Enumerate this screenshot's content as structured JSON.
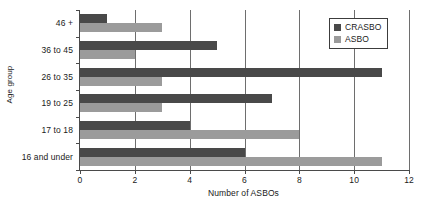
{
  "chart_data": {
    "type": "bar",
    "orientation": "horizontal",
    "title": "",
    "xlabel": "Number of ASBOs",
    "ylabel": "Age group",
    "categories": [
      "46 +",
      "36 to 45",
      "26 to 35",
      "19 to 25",
      "17 to 18",
      "16 and under"
    ],
    "series": [
      {
        "name": "CRASBO",
        "color": "#494949",
        "values": [
          1,
          5,
          11,
          7,
          4,
          6
        ]
      },
      {
        "name": "ASBO",
        "color": "#9b9b9b",
        "values": [
          3,
          2,
          3,
          3,
          8,
          11
        ]
      }
    ],
    "xlim": [
      0,
      12
    ],
    "xticks": [
      "0",
      "2",
      "4",
      "6",
      "8",
      "10",
      "12"
    ],
    "xtick_values": [
      0,
      2,
      4,
      6,
      8,
      10,
      12
    ],
    "grid": "vertical",
    "legend_position": "top-right"
  },
  "legend": {
    "items": [
      {
        "label": "CRASBO",
        "swatch": "crasbo"
      },
      {
        "label": "ASBO",
        "swatch": "asbo"
      }
    ]
  }
}
